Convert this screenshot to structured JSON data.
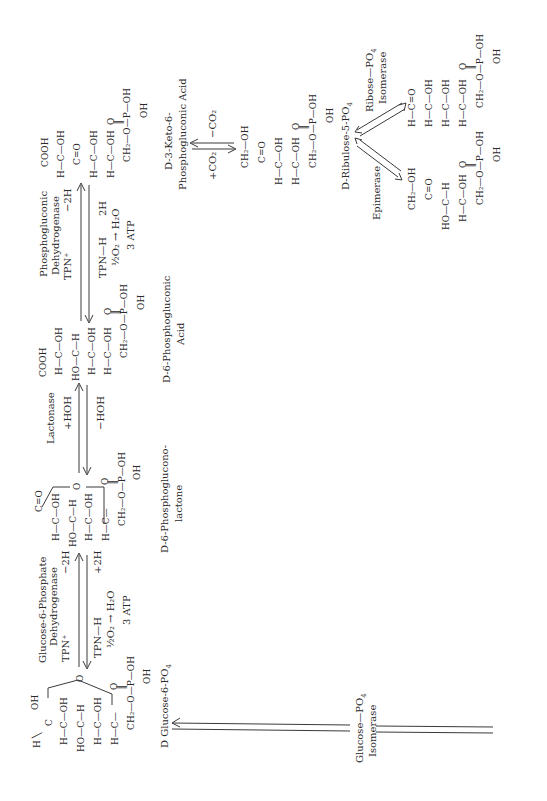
{
  "diagram": {
    "orientation": "rotated -90deg (text reads bottom-to-top)",
    "colors": {
      "ink": "#2a2a2a",
      "background": "#ffffff"
    },
    "compounds": {
      "glucose6p": {
        "label": "D Glucose-6-PO",
        "label_sub": "4",
        "rows": [
          "H",
          "OH",
          "H—C—OH",
          "HO—C—H",
          "H—C—OH",
          "H—C—",
          "CH₂—O—P—OH",
          "O",
          "OH",
          "O"
        ]
      },
      "lactone": {
        "label_line1": "D-6-Phosphoglucono-",
        "label_line2": "lactone",
        "rows": [
          "C=O",
          "H—C—OH",
          "HO—C—H",
          "H—C—OH",
          "H—C—",
          "CH₂—O—P—OH",
          "O",
          "OH",
          "O"
        ]
      },
      "gluconic": {
        "label_line1": "D-6-Phosphogluconic",
        "label_line2": "Acid",
        "rows": [
          "COOH",
          "H—C—OH",
          "HO—C—H",
          "H—C—OH",
          "H—C—OH",
          "CH₂—O—P—OH",
          "O",
          "OH"
        ]
      },
      "keto": {
        "label_line1": "D-3-Keto-6-",
        "label_line2": "Phosphogluconic  Acid",
        "rows": [
          "COOH",
          "H—C—OH",
          "C=O",
          "H—C—OH",
          "H—C—OH",
          "CH₂—O—P—OH",
          "O",
          "OH"
        ]
      },
      "ribulose": {
        "label": "D-Ribulose-5-PO",
        "label_sub": "4",
        "rows": [
          "CH₂—OH",
          "C=O",
          "H—C—OH",
          "H—C—OH",
          "CH₂—O—P—OH",
          "O",
          "OH"
        ]
      },
      "ribose": {
        "rows": [
          "H—C=O",
          "H—C—OH",
          "H—C—OH",
          "H—C—OH",
          "CH₂—O—P—OH",
          "O",
          "OH"
        ]
      },
      "xylulose": {
        "rows": [
          "CH₂—OH",
          "C=O",
          "HO—C—H",
          "H—C—OH",
          "CH₂—O—P—OH",
          "O",
          "OH"
        ]
      }
    },
    "reactions": {
      "isomerase": {
        "enzyme_line1": "Glucose—PO",
        "enzyme_sub": "4",
        "enzyme_line2": "Isomerase"
      },
      "g6pdh": {
        "enzyme_line1": "Glucose-6-Phosphate",
        "enzyme_line2": "Dehydrogenase",
        "cofactor": "TPN⁺",
        "minus_2h": "−2H",
        "tpnh": "TPN—H",
        "plus_2h": "+2H",
        "oxygen": "½O₂ → H₂O",
        "atp": "3 ATP"
      },
      "lactonase": {
        "enzyme": "Lactonase",
        "plus_hoh": "+HOH",
        "minus_hoh": "−HOH"
      },
      "pgdh": {
        "enzyme_line1": "Phosphogluconic",
        "enzyme_line2": "Dehydrogenase",
        "cofactor": "TPN⁺",
        "minus_2h": "−2H",
        "tpnh": "TPN—H",
        "h2": "2H",
        "oxygen": "½O₂ → H₂O",
        "atp": "3 ATP"
      },
      "decarboxylation": {
        "plus_co2": "+CO₂",
        "minus_co2": "−CO₂"
      },
      "ribose_isomerase": {
        "enzyme_line1": "Ribose—PO",
        "enzyme_sub": "4",
        "enzyme_line2": "Isomerase"
      },
      "epimerase": {
        "enzyme": "Epimerase"
      }
    }
  }
}
